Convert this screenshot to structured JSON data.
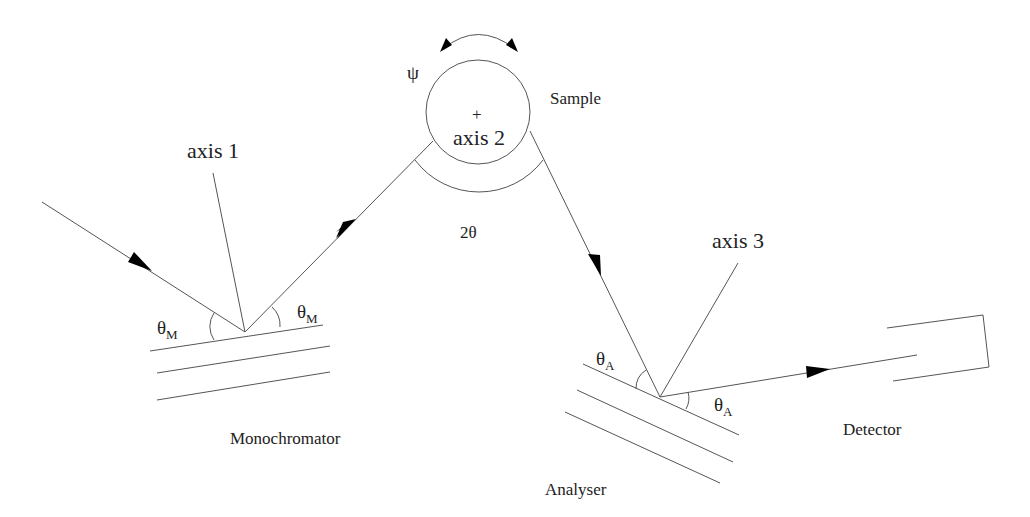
{
  "diagram": {
    "labels": {
      "axis1": "axis 1",
      "axis2": "axis 2",
      "axis3": "axis 3",
      "sample": "Sample",
      "monochromator": "Monochromator",
      "analyser": "Analyser",
      "detector": "Detector",
      "psi": "ψ",
      "two_theta": "2θ",
      "theta": "θ",
      "sub_M": "M",
      "sub_A": "A",
      "center_mark": "+"
    },
    "components": [
      "Monochromator",
      "Sample",
      "Analyser",
      "Detector"
    ],
    "beam_path": [
      "source",
      "Monochromator",
      "Sample",
      "Analyser",
      "Detector"
    ],
    "angles": [
      {
        "name": "θM",
        "location": "Monochromator",
        "count": 2
      },
      {
        "name": "2θ",
        "location": "Sample"
      },
      {
        "name": "ψ",
        "location": "Sample",
        "type": "rotation"
      },
      {
        "name": "θA",
        "location": "Analyser",
        "count": 2
      }
    ],
    "colors": {
      "line": "#555555",
      "text": "#222222",
      "background": "#ffffff"
    }
  }
}
